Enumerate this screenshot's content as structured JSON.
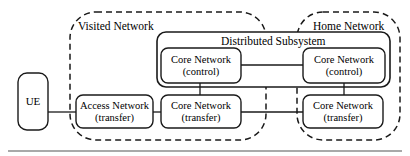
{
  "figure": {
    "type": "network-architecture-diagram",
    "background_color": "#ffffff",
    "line_color": "#1a1a1a",
    "text_color": "#000000"
  },
  "zones": [
    {
      "id": "visited-network",
      "label": "Visited Network",
      "style": "dashed-rounded",
      "x": 70,
      "y": 12,
      "w": 196,
      "h": 128
    },
    {
      "id": "home-network",
      "label": "Home Network",
      "style": "dashed-rounded",
      "x": 297,
      "y": 12,
      "w": 103,
      "h": 128
    }
  ],
  "subsystem": {
    "id": "distributed-subsystem",
    "label": "Distributed Subsystem",
    "style": "solid-rounded",
    "x": 157,
    "y": 32,
    "w": 233,
    "h": 55
  },
  "nodes": [
    {
      "id": "ue",
      "line1": "UE",
      "line2": "",
      "x": 18,
      "y": 73,
      "w": 30,
      "h": 57
    },
    {
      "id": "access-network-transfer",
      "line1": "Access Network",
      "line2": "(transfer)",
      "x": 76,
      "y": 95,
      "w": 77,
      "h": 33
    },
    {
      "id": "visited-core-network-transfer",
      "line1": "Core Network",
      "line2": "(transfer)",
      "x": 161,
      "y": 95,
      "w": 80,
      "h": 33
    },
    {
      "id": "home-core-network-transfer",
      "line1": "Core Network",
      "line2": "(transfer)",
      "x": 303,
      "y": 95,
      "w": 80,
      "h": 33
    },
    {
      "id": "visited-core-network-control",
      "line1": "Core Network",
      "line2": "(control)",
      "x": 161,
      "y": 48,
      "w": 80,
      "h": 35
    },
    {
      "id": "home-core-network-control",
      "line1": "Core Network",
      "line2": "(control)",
      "x": 303,
      "y": 48,
      "w": 82,
      "h": 35
    }
  ],
  "links": [
    {
      "id": "ue-to-access",
      "from": "ue",
      "to": "access-network-transfer"
    },
    {
      "id": "access-to-visited-core-transfer",
      "from": "access-network-transfer",
      "to": "visited-core-network-transfer"
    },
    {
      "id": "visited-core-transfer-to-home-core-transfer",
      "from": "visited-core-network-transfer",
      "to": "home-core-network-transfer"
    },
    {
      "id": "visited-control-to-home-control",
      "from": "visited-core-network-control",
      "to": "home-core-network-control"
    },
    {
      "id": "visited-control-to-visited-transfer",
      "from": "visited-core-network-control",
      "to": "visited-core-network-transfer"
    },
    {
      "id": "home-control-to-home-transfer",
      "from": "home-core-network-control",
      "to": "home-core-network-transfer"
    }
  ],
  "footer_rule": {
    "id": "bottom-rule",
    "x1": 8,
    "x2": 402,
    "y": 151
  }
}
